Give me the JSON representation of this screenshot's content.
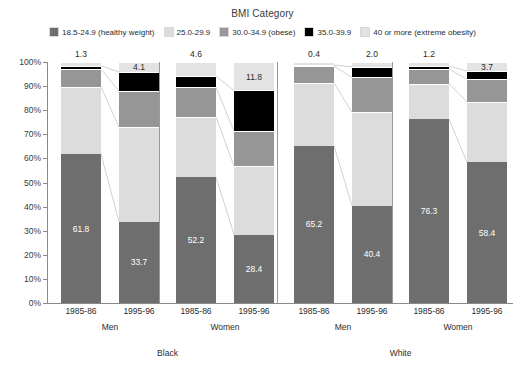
{
  "chart_data": {
    "type": "bar",
    "title": "BMI Category",
    "subtitle": "",
    "xlabel": "",
    "ylabel": "",
    "ylim": [
      0,
      100
    ],
    "stacked": true,
    "stack_mode": "percent",
    "grid": false,
    "legend_position": "top",
    "ytick_labels": [
      "0%",
      "10%",
      "20%",
      "30%",
      "40%",
      "50%",
      "60%",
      "70%",
      "80%",
      "90%",
      "100%"
    ],
    "ytick_values": [
      0,
      10,
      20,
      30,
      40,
      50,
      60,
      70,
      80,
      90,
      100
    ],
    "categories": [
      "1985-86",
      "1995-96",
      "1985-86",
      "1995-96",
      "1985-86",
      "1995-96",
      "1985-86",
      "1995-96"
    ],
    "group_levels": {
      "sex": [
        "Men",
        "Women",
        "Men",
        "Women"
      ],
      "race": [
        "Black",
        "White"
      ]
    },
    "series": [
      {
        "name": "18.5-24.9 (healthy weight)",
        "color": "#6e6e6e",
        "values": [
          61.8,
          33.7,
          52.2,
          28.4,
          65.2,
          40.4,
          76.3,
          58.4
        ]
      },
      {
        "name": "25.0-29.9",
        "color": "#dcdcdc",
        "values": [
          28.0,
          39.2,
          25.0,
          28.4,
          26.1,
          38.7,
          14.7,
          25.0
        ]
      },
      {
        "name": "30.0-34.9 (obese)",
        "color": "#969696",
        "values": [
          7.3,
          15.0,
          12.3,
          14.5,
          7.0,
          14.5,
          6.1,
          9.4
        ]
      },
      {
        "name": "35.0-39.9",
        "color": "#000000",
        "values": [
          1.3,
          8.0,
          4.6,
          16.9,
          0.4,
          4.4,
          1.2,
          3.5
        ]
      },
      {
        "name": "40 or more (extreme obesity)",
        "color": "#e3e3e3",
        "values": [
          1.6,
          4.1,
          5.9,
          11.8,
          1.3,
          2.0,
          1.7,
          3.7
        ]
      }
    ],
    "data_labels": [
      {
        "bar": 0,
        "series": 0,
        "text": "61.8",
        "placement": "inside"
      },
      {
        "bar": 1,
        "series": 0,
        "text": "33.7",
        "placement": "inside"
      },
      {
        "bar": 2,
        "series": 0,
        "text": "52.2",
        "placement": "inside"
      },
      {
        "bar": 3,
        "series": 0,
        "text": "28.4",
        "placement": "inside"
      },
      {
        "bar": 4,
        "series": 0,
        "text": "65.2",
        "placement": "inside"
      },
      {
        "bar": 5,
        "series": 0,
        "text": "40.4",
        "placement": "inside"
      },
      {
        "bar": 6,
        "series": 0,
        "text": "76.3",
        "placement": "inside"
      },
      {
        "bar": 7,
        "series": 0,
        "text": "58.4",
        "placement": "inside"
      },
      {
        "bar": 0,
        "series": 3,
        "text": "1.3",
        "placement": "above"
      },
      {
        "bar": 1,
        "series": 4,
        "text": "4.1",
        "placement": "inside-top"
      },
      {
        "bar": 2,
        "series": 3,
        "text": "4.6",
        "placement": "above"
      },
      {
        "bar": 3,
        "series": 4,
        "text": "11.8",
        "placement": "inside-top"
      },
      {
        "bar": 4,
        "series": 3,
        "text": "0.4",
        "placement": "above"
      },
      {
        "bar": 5,
        "series": 3,
        "text": "2.0",
        "placement": "above"
      },
      {
        "bar": 6,
        "series": 3,
        "text": "1.2",
        "placement": "above"
      },
      {
        "bar": 7,
        "series": 4,
        "text": "3.7",
        "placement": "inside-top"
      }
    ]
  },
  "legend": {
    "items": [
      {
        "label": "18.5-24.9 (healthy weight)",
        "color": "#6e6e6e"
      },
      {
        "label": "25.0-29.9",
        "color": "#dcdcdc"
      },
      {
        "label": "30.0-34.9 (obese)",
        "color": "#969696"
      },
      {
        "label": "35.0-39.9",
        "color": "#000000"
      },
      {
        "label": "40 or more (extreme obesity)",
        "color": "#e3e3e3"
      }
    ]
  }
}
